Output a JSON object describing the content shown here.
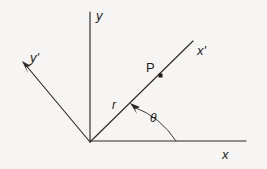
{
  "figure": {
    "background_color": "#f6f5f3",
    "line_color": "#2b2b2b",
    "text_color": "#1c1c1c"
  },
  "labels": {
    "y_axis": "y",
    "x_axis": "x",
    "x_prime_axis": "x'",
    "y_prime_axis": "y'",
    "point": "P",
    "radius": "r",
    "angle": "θ"
  },
  "geometry": {
    "origin": {
      "x": 90,
      "y": 142
    },
    "y_axis": {
      "x1": 90,
      "y1": 12,
      "x2": 90,
      "y2": 142
    },
    "x_axis": {
      "x1": 90,
      "y1": 141,
      "x2": 246,
      "y2": 141
    },
    "x_prime_axis": {
      "x1": 90,
      "y1": 142,
      "x2": 193,
      "y2": 41
    },
    "y_prime_axis": {
      "x1": 90,
      "y1": 142,
      "x2": 22,
      "y2": 61
    },
    "point_marker": {
      "x": 160,
      "y": 75,
      "size": 3
    },
    "angle_arc": {
      "start_x": 176,
      "start_y": 141,
      "end_x": 133,
      "end_y": 105,
      "radius": 86
    }
  },
  "label_positions": {
    "y_axis": {
      "x": 96,
      "y": 19
    },
    "x_axis": {
      "x": 222,
      "y": 159
    },
    "x_prime_axis": {
      "x": 197,
      "y": 54
    },
    "y_prime_axis": {
      "x": 31,
      "y": 62
    },
    "point": {
      "x": 146,
      "y": 72
    },
    "radius": {
      "x": 111,
      "y": 109
    },
    "angle": {
      "x": 150,
      "y": 122
    }
  }
}
